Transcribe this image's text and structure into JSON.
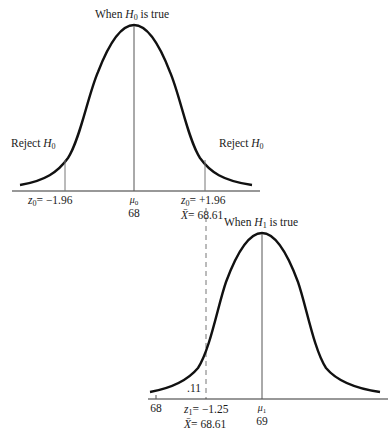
{
  "diagram": {
    "type": "hypothesis-test-power-illustration",
    "top_panel": {
      "title_prefix": "When ",
      "title_var": "H",
      "title_sub": "0",
      "title_suffix": " is true",
      "reject_left": {
        "prefix": "Reject ",
        "var": "H",
        "sub": "0"
      },
      "reject_right": {
        "prefix": "Reject ",
        "var": "H",
        "sub": "0"
      },
      "left_cut": {
        "var": "z",
        "sub": "0",
        "text": "= −1.96"
      },
      "mean": {
        "var": "μ",
        "sub": "0",
        "value": "68"
      },
      "right_cut": {
        "var": "z",
        "sub": "0",
        "text": "= +1.96",
        "xbar_var": "X̄",
        "xbar_text": "= 68.61"
      }
    },
    "bottom_panel": {
      "title_prefix": "When ",
      "title_var": "H",
      "title_sub": "1",
      "title_suffix": " is true",
      "left_tick": "68",
      "area_label": ".11",
      "cut": {
        "var": "z",
        "sub": "1",
        "text": "= −1.25",
        "xbar_var": "X̄",
        "xbar_text": "= 68.61"
      },
      "mean": {
        "var": "μ",
        "sub": "1",
        "value": "69"
      }
    },
    "colors": {
      "curve": "#111111",
      "axis": "#333333",
      "line": "#555555",
      "dashed": "#777777"
    }
  }
}
